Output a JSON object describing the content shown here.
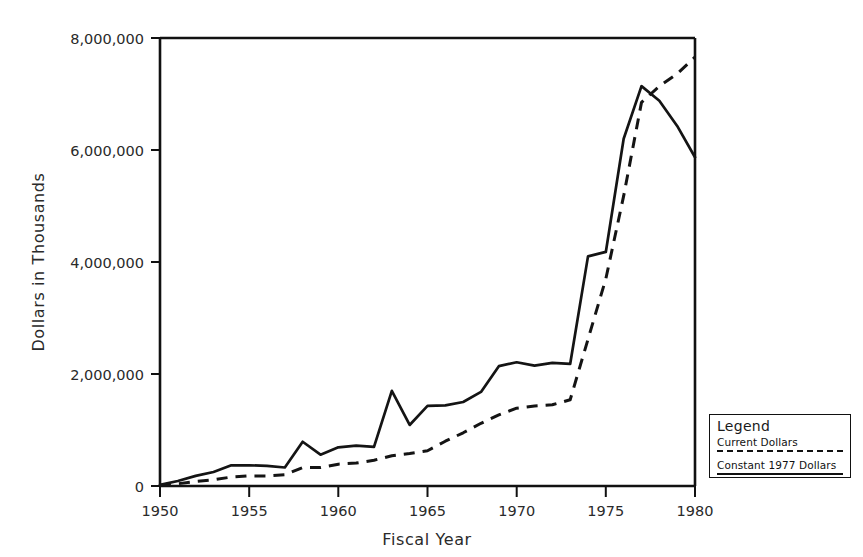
{
  "chart_data": {
    "type": "line",
    "title": "",
    "xlabel": "Fiscal Year",
    "ylabel": "Dollars in Thousands",
    "xlim": [
      1950,
      1980
    ],
    "ylim": [
      0,
      8000000
    ],
    "grid": false,
    "legend_position": "outside-right-bottom",
    "x_ticks": [
      "1950",
      "1955",
      "1960",
      "1965",
      "1970",
      "1975",
      "1980"
    ],
    "x_tick_values": [
      1950,
      1955,
      1960,
      1965,
      1970,
      1975,
      1980
    ],
    "y_ticks": [
      "0",
      "2,000,000",
      "4,000,000",
      "6,000,000",
      "8,000,000"
    ],
    "y_tick_values": [
      0,
      2000000,
      4000000,
      6000000,
      8000000
    ],
    "x": [
      1950,
      1951,
      1952,
      1953,
      1954,
      1955,
      1956,
      1957,
      1958,
      1959,
      1960,
      1961,
      1962,
      1963,
      1964,
      1965,
      1966,
      1967,
      1968,
      1969,
      1970,
      1971,
      1972,
      1973,
      1974,
      1975,
      1976,
      1977,
      1978,
      1979,
      1980
    ],
    "series": [
      {
        "name": "Current Dollars",
        "style": "dashed",
        "values": [
          10000,
          40000,
          80000,
          110000,
          160000,
          180000,
          180000,
          200000,
          330000,
          330000,
          390000,
          410000,
          460000,
          540000,
          580000,
          630000,
          800000,
          950000,
          1120000,
          1270000,
          1390000,
          1430000,
          1450000,
          1540000,
          2620000,
          3700000,
          5180000,
          6850000,
          7140000,
          7360000,
          7660000
        ]
      },
      {
        "name": "Constant 1977 Dollars",
        "style": "solid",
        "values": [
          20000,
          90000,
          180000,
          250000,
          370000,
          370000,
          360000,
          330000,
          790000,
          560000,
          690000,
          720000,
          700000,
          1700000,
          1090000,
          1430000,
          1440000,
          1500000,
          1680000,
          2140000,
          2210000,
          2150000,
          2200000,
          2180000,
          4100000,
          4180000,
          6200000,
          7140000,
          6880000,
          6430000,
          5870000
        ]
      }
    ]
  },
  "axis": {
    "y_label": "Dollars in Thousands",
    "x_label": "Fiscal Year",
    "y_tick_labels": [
      "8,000,000",
      "6,000,000",
      "4,000,000",
      "2,000,000",
      "0"
    ],
    "x_tick_labels": [
      "1950",
      "1955",
      "1960",
      "1965",
      "1970",
      "1975",
      "1980"
    ]
  },
  "legend": {
    "title": "Legend",
    "entries": [
      {
        "label": "Current Dollars",
        "style": "dashed"
      },
      {
        "label": "Constant 1977 Dollars",
        "style": "solid"
      }
    ]
  },
  "colors": {
    "ink": "#141414",
    "background": "#ffffff"
  }
}
